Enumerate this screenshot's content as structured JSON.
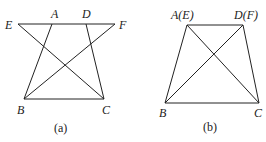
{
  "figures": [
    {
      "caption": "(a)",
      "labels": {
        "E": "E",
        "A": "A",
        "D": "D",
        "F": "F",
        "B": "B",
        "C": "C"
      }
    },
    {
      "caption": "(b)",
      "labels": {
        "A": "A(E)",
        "D": "D(F)",
        "B": "B",
        "C": "C"
      }
    }
  ]
}
